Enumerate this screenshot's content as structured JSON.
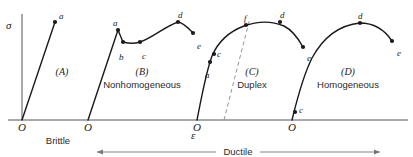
{
  "figure": {
    "axes": {
      "stress_label": "σ",
      "strain_label": "ε"
    },
    "origins": [
      {
        "label": "O",
        "x": 22
      },
      {
        "label": "O",
        "x": 88
      },
      {
        "label": "O",
        "x": 197
      },
      {
        "label": "O",
        "x": 292
      }
    ],
    "ranges": [
      {
        "name": "brittle",
        "label": "Brittle",
        "x": 58,
        "y": 136,
        "arrows": "none"
      },
      {
        "name": "ductile",
        "label": "Ductile",
        "x": 238,
        "y": 147,
        "arrows": "both",
        "from_x": 97,
        "to_x": 380
      }
    ],
    "regions": [
      {
        "tag": "(A)",
        "name": "",
        "cx": 62,
        "tag_y": 67,
        "name_y": 80
      },
      {
        "tag": "(B)",
        "name": "Nonhomogeneous",
        "cx": 142,
        "tag_y": 67,
        "name_y": 80
      },
      {
        "tag": "(C)",
        "name": "Duplex",
        "cx": 252,
        "tag_y": 67,
        "name_y": 80
      },
      {
        "tag": "(D)",
        "name": "Homogeneous",
        "cx": 348,
        "tag_y": 67,
        "name_y": 80
      }
    ],
    "curves": [
      {
        "name": "curve-a-brittle",
        "path": "M 22,120 L 55,22",
        "points": [
          {
            "label": "a",
            "x": 55,
            "y": 22,
            "lx": 59,
            "ly": 12
          }
        ]
      },
      {
        "name": "curve-b-nonhomogeneous",
        "path": "M 88,120 L 118,30 L 123,42 C 130,44 134,44 140,42 C 152,38 164,27 178,22 C 184,23 188,28 193,33",
        "points": [
          {
            "label": "a",
            "x": 118,
            "y": 30,
            "lx": 113,
            "ly": 19
          },
          {
            "label": "b",
            "x": 123,
            "y": 42,
            "lx": 119,
            "ly": 53
          },
          {
            "label": "c",
            "x": 140,
            "y": 42,
            "lx": 142,
            "ly": 52
          },
          {
            "label": "d",
            "x": 178,
            "y": 22,
            "lx": 178,
            "ly": 11
          },
          {
            "label": "e",
            "x": 193,
            "y": 33,
            "lx": 197,
            "ly": 42
          }
        ]
      },
      {
        "name": "curve-c-duplex",
        "path": "M 197,120 C 201,100 206,72 212,56 C 218,42 228,32 244,26 C 258,21 272,21 284,26 C 292,30 298,38 303,47",
        "points": [
          {
            "label": "a",
            "x": 210,
            "y": 62,
            "lx": 205,
            "ly": 71
          },
          {
            "label": "c",
            "x": 214,
            "y": 54,
            "lx": 217,
            "ly": 50
          },
          {
            "label": "f",
            "x": 246,
            "y": 25,
            "lx": 244,
            "ly": 14
          },
          {
            "label": "d",
            "x": 280,
            "y": 22,
            "lx": 280,
            "ly": 11
          },
          {
            "label": "e",
            "x": 303,
            "y": 47,
            "lx": 307,
            "ly": 54
          }
        ]
      },
      {
        "name": "curve-d-homogeneous",
        "path": "M 292,120 C 296,104 302,78 312,58 C 324,36 340,25 360,23 C 374,23 384,29 392,41",
        "points": [
          {
            "label": "c",
            "x": 295,
            "y": 112,
            "lx": 299,
            "ly": 106
          },
          {
            "label": "d",
            "x": 360,
            "y": 23,
            "lx": 358,
            "ly": 12
          },
          {
            "label": "e",
            "x": 392,
            "y": 41,
            "lx": 397,
            "ly": 49
          }
        ]
      }
    ],
    "dashed_line": {
      "name": "duplex-transition-line",
      "path": "M 224,120 L 250,18"
    },
    "colors": {
      "ink": "#1a1a1a",
      "axis": "#555555",
      "dashed": "#888888",
      "arrow_line": "#777777"
    }
  }
}
